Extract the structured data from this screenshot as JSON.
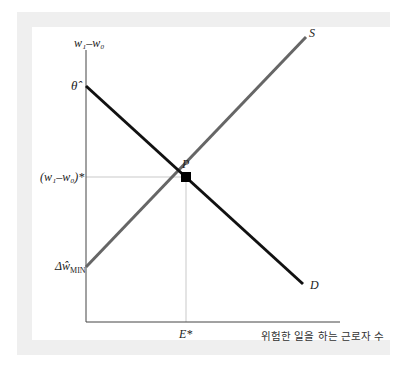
{
  "diagram": {
    "y_axis_label": "w₁–w₀",
    "x_axis_label": "위험한 일을 하는 근로자 수",
    "y_ticks": {
      "top": "θ̂",
      "equilibrium": "(w₁–w₀)*",
      "bottom": "Δŵ",
      "bottom_sub": "MIN"
    },
    "x_ticks": {
      "equilibrium": "E*"
    },
    "curves": [
      {
        "name": "S",
        "label": "S",
        "color": "#666666",
        "from": [
          86,
          267
        ],
        "to": [
          306,
          37
        ]
      },
      {
        "name": "D",
        "label": "D",
        "color": "#111111",
        "from": [
          86,
          86
        ],
        "to": [
          303,
          284
        ]
      }
    ],
    "equilibrium_point": {
      "label": "P",
      "x": 186,
      "y": 177
    },
    "colors": {
      "frame": "#efefef",
      "axis": "#444444",
      "guide": "#bbbbbb"
    }
  }
}
